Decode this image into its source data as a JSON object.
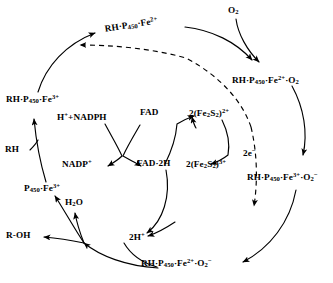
{
  "diagram": {
    "stroke_color": "#000000",
    "background_color": "#ffffff",
    "species": {
      "o2": "O2",
      "rh_p450_fe2": "RH·P450·Fe2+",
      "rh_p450_fe2_o2": "RH·P450·Fe2+·O2",
      "rh_p450_fe3": "RH·P450·Fe3+",
      "rh_p450_fe3_o2minus": "RH·P450·Fe3+·O2-",
      "rh_p450_fe2_o2minus": "RH·P450·Fe2+·O2-",
      "p450_fe3": "P450·Fe3+",
      "rh": "RH",
      "r_oh": "R-OH",
      "h_nadph": "H+ +NADPH",
      "nadp_plus": "NADP+",
      "fad": "FAD",
      "fad_2h": "FAD·2H",
      "fe2s2_2plus": "2(Fe2S2)2+",
      "fe2s2_3plus": "2(Fe2S2)3+",
      "two_electrons": "2e-",
      "water": "H2O",
      "two_protons": "2H+"
    },
    "edge_labels": {
      "electron_transfer": "2e-"
    }
  }
}
